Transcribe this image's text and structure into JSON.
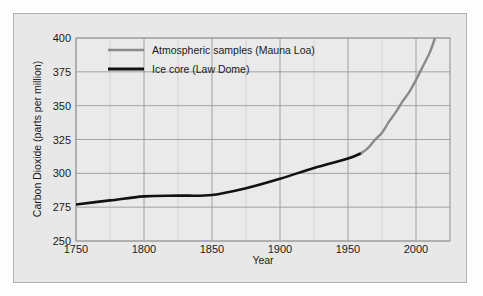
{
  "chart_data": {
    "type": "line",
    "title": "",
    "xlabel": "Year",
    "ylabel": "Carbon Dioxide (parts per million)",
    "xlim": [
      1750,
      2025
    ],
    "ylim": [
      250,
      400
    ],
    "xticks": [
      "1750",
      "1800",
      "1850",
      "1900",
      "1950",
      "2000"
    ],
    "xtick_values": [
      1750,
      1800,
      1850,
      1900,
      1950,
      2000
    ],
    "yticks": [
      "250",
      "275",
      "300",
      "325",
      "350",
      "375",
      "400"
    ],
    "ytick_values": [
      250,
      275,
      300,
      325,
      350,
      375,
      400
    ],
    "grid": true,
    "grid_minor_x_step": 25,
    "legend_position": "upper-left",
    "series": [
      {
        "name": "Atmospheric samples (Mauna Loa)",
        "color": "#8a8a8a",
        "x": [
          1960,
          1965,
          1970,
          1975,
          1980,
          1985,
          1990,
          1995,
          2000,
          2005,
          2010,
          2014
        ],
        "values": [
          315,
          319,
          325,
          330,
          338,
          345,
          353,
          360,
          369,
          379,
          389,
          400
        ]
      },
      {
        "name": "Ice core (Law Dome)",
        "color": "#111111",
        "x": [
          1750,
          1775,
          1800,
          1825,
          1850,
          1875,
          1900,
          1925,
          1950,
          1960
        ],
        "values": [
          277,
          280,
          283,
          283.5,
          284,
          289,
          296,
          304,
          311,
          315
        ]
      }
    ]
  },
  "legend": {
    "items": [
      {
        "label": "Atmospheric samples (Mauna Loa)",
        "color": "#8a8a8a"
      },
      {
        "label": "Ice core (Law Dome)",
        "color": "#111111"
      }
    ]
  },
  "axes": {
    "x_title": "Year",
    "y_title": "Carbon Dioxide (parts per million)"
  }
}
